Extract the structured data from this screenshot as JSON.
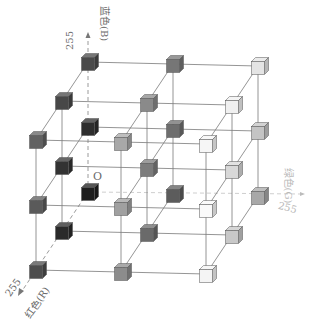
{
  "diagram": {
    "origin_label": "O",
    "axes": {
      "blue": {
        "label": "蓝色(B)",
        "max": "255"
      },
      "green": {
        "label": "绿色(G)",
        "max": "255"
      },
      "red": {
        "label": "红色(R)",
        "max": "255"
      }
    },
    "levels": 3,
    "colors": {
      "line": "#7a7a7a",
      "axis_dashed": "#9a9a9a",
      "label": "#6a6a6a",
      "label_faint": "#b8b8b8"
    },
    "cube_shades": [
      {
        "r": 0,
        "g": 0,
        "b": 0,
        "fill": "#1e1e1e"
      },
      {
        "r": 0,
        "g": 0,
        "b": 1,
        "fill": "#2e2e2e"
      },
      {
        "r": 0,
        "g": 0,
        "b": 2,
        "fill": "#4a4a4a"
      },
      {
        "r": 0,
        "g": 1,
        "b": 0,
        "fill": "#5c5c5c"
      },
      {
        "r": 0,
        "g": 1,
        "b": 1,
        "fill": "#6e6e6e"
      },
      {
        "r": 0,
        "g": 1,
        "b": 2,
        "fill": "#767676"
      },
      {
        "r": 0,
        "g": 2,
        "b": 0,
        "fill": "#a8a8a8"
      },
      {
        "r": 0,
        "g": 2,
        "b": 1,
        "fill": "#c4c4c4"
      },
      {
        "r": 0,
        "g": 2,
        "b": 2,
        "fill": "#e4e4e4"
      },
      {
        "r": 1,
        "g": 0,
        "b": 0,
        "fill": "#2a2a2a"
      },
      {
        "r": 1,
        "g": 0,
        "b": 1,
        "fill": "#333333"
      },
      {
        "r": 1,
        "g": 0,
        "b": 2,
        "fill": "#484848"
      },
      {
        "r": 1,
        "g": 1,
        "b": 0,
        "fill": "#6a6a6a"
      },
      {
        "r": 1,
        "g": 1,
        "b": 1,
        "fill": "#7c7c7c"
      },
      {
        "r": 1,
        "g": 1,
        "b": 2,
        "fill": "#8a8a8a"
      },
      {
        "r": 1,
        "g": 2,
        "b": 0,
        "fill": "#c8c8c8"
      },
      {
        "r": 1,
        "g": 2,
        "b": 1,
        "fill": "#d8d8d8"
      },
      {
        "r": 1,
        "g": 2,
        "b": 2,
        "fill": "#f0f0f0"
      },
      {
        "r": 2,
        "g": 0,
        "b": 0,
        "fill": "#4e4e4e"
      },
      {
        "r": 2,
        "g": 0,
        "b": 1,
        "fill": "#5a5a5a"
      },
      {
        "r": 2,
        "g": 0,
        "b": 2,
        "fill": "#626262"
      },
      {
        "r": 2,
        "g": 1,
        "b": 0,
        "fill": "#8c8c8c"
      },
      {
        "r": 2,
        "g": 1,
        "b": 1,
        "fill": "#a0a0a0"
      },
      {
        "r": 2,
        "g": 1,
        "b": 2,
        "fill": "#a8a8a8"
      },
      {
        "r": 2,
        "g": 2,
        "b": 0,
        "fill": "#f4f4f4"
      },
      {
        "r": 2,
        "g": 2,
        "b": 1,
        "fill": "#fafafa"
      },
      {
        "r": 2,
        "g": 2,
        "b": 2,
        "fill": "#f6f6f6"
      }
    ]
  }
}
